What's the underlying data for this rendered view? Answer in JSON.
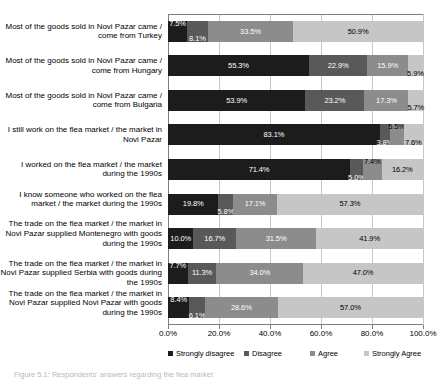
{
  "chart_data": {
    "type": "bar",
    "subtype": "horizontal-stacked-100",
    "title": "",
    "subtitle": "",
    "xlabel": "",
    "ylabel": "",
    "xlim": [
      0,
      100
    ],
    "xtick_labels": [
      "0.0%",
      "20.0%",
      "40.0%",
      "60.0%",
      "80.0%",
      "100.0%"
    ],
    "xticks": [
      0,
      20,
      40,
      60,
      80,
      100
    ],
    "grid": true,
    "legend_position": "bottom",
    "legend": [
      "Strongly disagree",
      "Disagree",
      "Agree",
      "Strongly Agree"
    ],
    "series_colors": [
      "#1c1c1c",
      "#595959",
      "#8c8c8c",
      "#c6c6c6"
    ],
    "categories": [
      "Most of the goods sold in Novi Pazar came / come from Turkey",
      "Most of the goods sold in Novi Pazar came / come from Hungary",
      "Most of the goods sold in Novi Pazar came / come from Bulgaria",
      "I still work on the flea market / the market in Novi Pazar",
      "I worked on the flea market / the market during the 1990s",
      "I know someone who worked on the flea market / the market during the 1990s",
      "The trade on the flea market / the market in Novi Pazar supplied Montenegro with goods during the 1990s",
      "The trade on the flea market / the market in Novi Pazar supplied Serbia with goods during the 1990s",
      "The trade on the flea market / the market in Novi Pazar supplied Novi Pazar with goods during the 1990s"
    ],
    "series": [
      {
        "name": "Strongly disagree",
        "values": [
          7.5,
          55.3,
          53.9,
          83.1,
          71.4,
          19.8,
          10.0,
          7.7,
          8.4
        ]
      },
      {
        "name": "Disagree",
        "values": [
          8.1,
          22.9,
          23.2,
          3.8,
          5.0,
          5.8,
          16.7,
          11.3,
          6.1
        ]
      },
      {
        "name": "Agree",
        "values": [
          33.5,
          15.9,
          17.3,
          5.5,
          7.4,
          17.1,
          31.5,
          34.0,
          28.6
        ]
      },
      {
        "name": "Strongly Agree",
        "values": [
          50.9,
          5.9,
          5.7,
          7.6,
          16.2,
          57.3,
          41.9,
          47.0,
          57.0
        ]
      }
    ],
    "data_labels": [
      [
        "7.5%",
        "8.1%",
        "33.5%",
        "50.9%"
      ],
      [
        "55.3%",
        "22.9%",
        "15.9%",
        "5.9%"
      ],
      [
        "53.9%",
        "23.2%",
        "17.3%",
        "5.7%"
      ],
      [
        "83.1%",
        "3.8%",
        "5.5%",
        "7.6%"
      ],
      [
        "71.4%",
        "5.0%",
        "7.4%",
        "16.2%"
      ],
      [
        "19.8%",
        "5.8%",
        "17.1%",
        "57.3%"
      ],
      [
        "10.0%",
        "16.7%",
        "31.5%",
        "41.9%"
      ],
      [
        "7.7%",
        "11.3%",
        "34.0%",
        "47.0%"
      ],
      [
        "8.4%",
        "6.1%",
        "28.6%",
        "57.0%"
      ]
    ]
  },
  "caption": {
    "text": "Figure 5.1: Respondents' answers regarding the flea market"
  }
}
